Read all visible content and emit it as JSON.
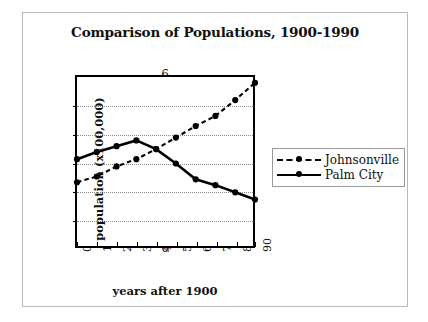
{
  "chart_data": {
    "type": "line",
    "title": "Comparison of Populations, 1900-1990",
    "xlabel": "years after 1900",
    "ylabel": "population  (x100,000)",
    "x": [
      0,
      10,
      20,
      30,
      40,
      50,
      60,
      70,
      80,
      90
    ],
    "xticklabels": [
      "0",
      "10",
      "20",
      "30",
      "40",
      "50",
      "60",
      "70",
      "80",
      "90"
    ],
    "yticklabels": [
      "0",
      "1",
      "2",
      "3",
      "4",
      "5",
      "6"
    ],
    "yticks": [
      0,
      1,
      2,
      3,
      4,
      5,
      6
    ],
    "xlim": [
      0,
      90
    ],
    "ylim": [
      0,
      6
    ],
    "grid": "horizontal-dotted",
    "legend_position": "right",
    "series": [
      {
        "name": "Johnsonville",
        "style": "dashed",
        "marker": "circle",
        "color": "#000000",
        "values": [
          2.35,
          2.55,
          2.9,
          3.15,
          3.5,
          3.9,
          4.3,
          4.65,
          5.2,
          5.8
        ]
      },
      {
        "name": "Palm City",
        "style": "solid",
        "marker": "circle",
        "color": "#000000",
        "values": [
          3.15,
          3.4,
          3.6,
          3.8,
          3.5,
          3.0,
          2.45,
          2.25,
          2.0,
          1.75
        ]
      }
    ]
  },
  "legend": {
    "items": [
      {
        "label": "Johnsonville",
        "style": "dashed"
      },
      {
        "label": "Palm City",
        "style": "solid"
      }
    ]
  },
  "colors": {
    "ink": "#000000",
    "grid": "#8d8d8d",
    "frame": "#b9b9b9",
    "background": "#ffffff"
  }
}
